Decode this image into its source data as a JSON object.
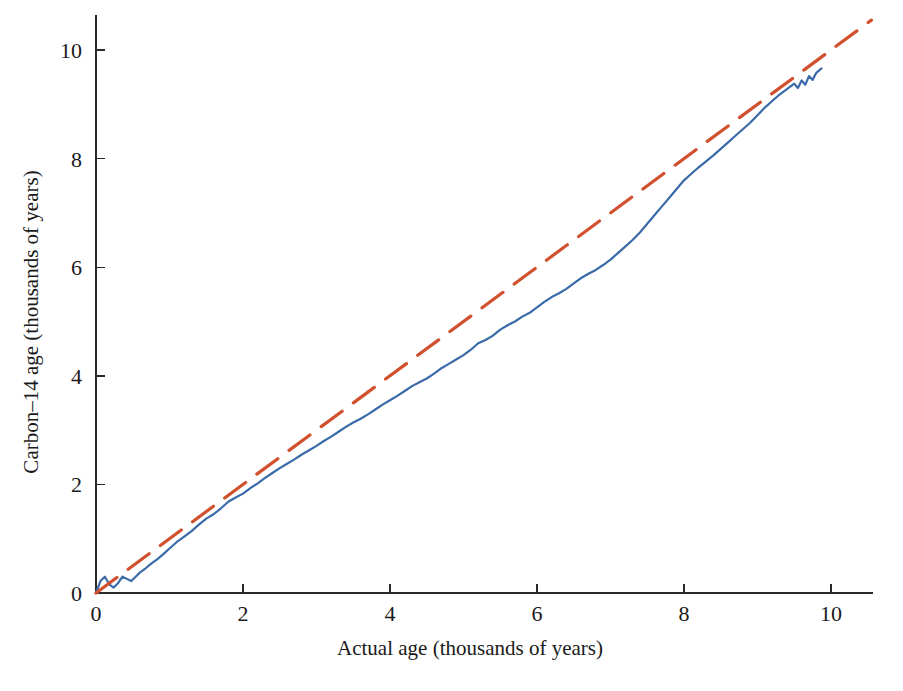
{
  "figure": {
    "width": 903,
    "height": 691,
    "background": "#ffffff"
  },
  "chart_data": {
    "type": "line",
    "title": "",
    "xlabel": "Actual age (thousands of years)",
    "ylabel": "Carbon–14 age (thousands of years)",
    "xlim": [
      0,
      10.55
    ],
    "ylim": [
      0,
      10.6
    ],
    "xticks": [
      0,
      2,
      4,
      6,
      8,
      10
    ],
    "xticklabels": [
      "0",
      "2",
      "4",
      "6",
      "8",
      "10"
    ],
    "yticks": [
      0,
      2,
      4,
      6,
      8,
      10
    ],
    "yticklabels": [
      "0",
      "2",
      "4",
      "6",
      "8",
      "10"
    ],
    "grid": false,
    "legend": null,
    "series": [
      {
        "name": "Carbon-14 calibration curve",
        "color": "#3a6aa8",
        "style": "solid",
        "linewidth": 2.2,
        "x": [
          0.0,
          0.06,
          0.12,
          0.18,
          0.24,
          0.3,
          0.36,
          0.42,
          0.48,
          0.54,
          0.6,
          0.68,
          0.76,
          0.84,
          0.92,
          1.0,
          1.1,
          1.2,
          1.3,
          1.4,
          1.5,
          1.6,
          1.7,
          1.8,
          1.9,
          2.0,
          2.1,
          2.2,
          2.3,
          2.4,
          2.5,
          2.6,
          2.7,
          2.8,
          2.9,
          3.0,
          3.1,
          3.2,
          3.3,
          3.4,
          3.5,
          3.6,
          3.7,
          3.8,
          3.9,
          4.0,
          4.1,
          4.2,
          4.3,
          4.4,
          4.5,
          4.6,
          4.7,
          4.8,
          4.9,
          5.0,
          5.1,
          5.2,
          5.3,
          5.4,
          5.5,
          5.6,
          5.7,
          5.8,
          5.9,
          6.0,
          6.1,
          6.2,
          6.3,
          6.4,
          6.5,
          6.6,
          6.7,
          6.8,
          6.9,
          7.0,
          7.1,
          7.2,
          7.3,
          7.4,
          7.5,
          7.6,
          7.7,
          7.8,
          7.9,
          8.0,
          8.1,
          8.2,
          8.3,
          8.4,
          8.5,
          8.6,
          8.7,
          8.8,
          8.9,
          9.0,
          9.1,
          9.2,
          9.3,
          9.4,
          9.5,
          9.55,
          9.6,
          9.65,
          9.7,
          9.75,
          9.8,
          9.87
        ],
        "y": [
          0.0,
          0.22,
          0.3,
          0.16,
          0.1,
          0.18,
          0.3,
          0.26,
          0.22,
          0.3,
          0.38,
          0.46,
          0.55,
          0.63,
          0.72,
          0.82,
          0.94,
          1.04,
          1.14,
          1.26,
          1.37,
          1.45,
          1.56,
          1.68,
          1.76,
          1.83,
          1.93,
          2.02,
          2.12,
          2.21,
          2.3,
          2.38,
          2.46,
          2.55,
          2.63,
          2.71,
          2.8,
          2.88,
          2.97,
          3.06,
          3.14,
          3.21,
          3.29,
          3.38,
          3.47,
          3.55,
          3.63,
          3.72,
          3.81,
          3.88,
          3.95,
          4.04,
          4.14,
          4.22,
          4.3,
          4.38,
          4.48,
          4.6,
          4.66,
          4.74,
          4.85,
          4.93,
          5.0,
          5.09,
          5.16,
          5.26,
          5.36,
          5.45,
          5.52,
          5.6,
          5.7,
          5.8,
          5.88,
          5.95,
          6.04,
          6.14,
          6.26,
          6.38,
          6.5,
          6.64,
          6.8,
          6.96,
          7.12,
          7.28,
          7.44,
          7.6,
          7.72,
          7.84,
          7.95,
          8.06,
          8.18,
          8.3,
          8.42,
          8.54,
          8.66,
          8.8,
          8.94,
          9.06,
          9.18,
          9.28,
          9.38,
          9.3,
          9.44,
          9.36,
          9.52,
          9.45,
          9.58,
          9.66
        ]
      },
      {
        "name": "1:1 reference line",
        "color": "#d1502e",
        "style": "dashed",
        "linewidth": 3.2,
        "dash": "26 14",
        "x": [
          0,
          10.55
        ],
        "y": [
          0,
          10.55
        ]
      }
    ]
  },
  "axes": {
    "x_axis_name": "x-axis",
    "y_axis_name": "y-axis"
  }
}
